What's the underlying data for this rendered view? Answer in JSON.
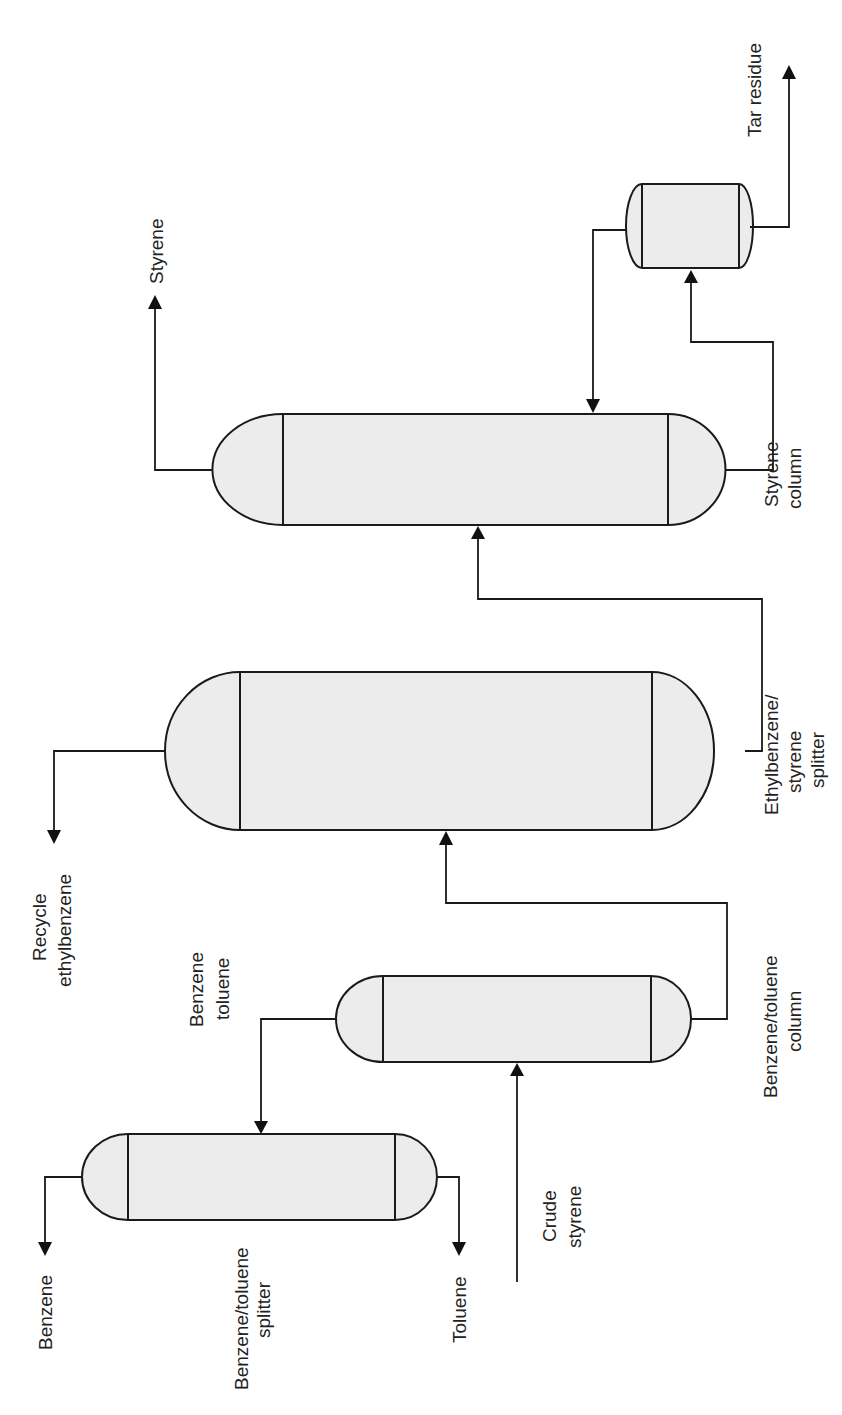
{
  "diagram": {
    "type": "process flow diagram",
    "orientation": "rotated 90 degrees counter-clockwise",
    "colors": {
      "vessel_fill": "#ececec",
      "stroke": "#1a1a1a",
      "text": "#222222"
    },
    "vessels": [
      {
        "id": "benzene-toluene-splitter",
        "label_line1": "Benzene/toluene",
        "label_line2": "splitter"
      },
      {
        "id": "benzene-toluene-column",
        "label_line1": "Benzene/toluene",
        "label_line2": "column"
      },
      {
        "id": "ethylbenzene-styrene-splitter",
        "label_line1": "Ethylbenzene/",
        "label_line2": "styrene",
        "label_line3": "splitter"
      },
      {
        "id": "styrene-column",
        "label_line1": "Styrene",
        "label_line2": "column"
      },
      {
        "id": "tar-drum",
        "label_line1": ""
      }
    ],
    "streams": {
      "benzene": "Benzene",
      "toluene": "Toluene",
      "crude_styrene_line1": "Crude",
      "crude_styrene_line2": "styrene",
      "benzene_toluene_line1": "Benzene",
      "benzene_toluene_line2": "toluene",
      "recycle_line1": "Recycle",
      "recycle_line2": "ethylbenzene",
      "styrene": "Styrene",
      "tar_residue": "Tar residue"
    }
  }
}
